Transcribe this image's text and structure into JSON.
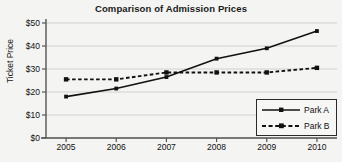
{
  "chart_data": {
    "type": "line",
    "title": "Comparison of Admission Prices",
    "xlabel": "",
    "ylabel": "Ticket Price",
    "categories": [
      "2005",
      "2006",
      "2007",
      "2008",
      "2009",
      "2010"
    ],
    "x": [
      2005,
      2006,
      2007,
      2008,
      2009,
      2010
    ],
    "ylim": [
      0,
      50
    ],
    "xlim": [
      2004.6,
      2010.4
    ],
    "yticks": [
      0,
      10,
      20,
      30,
      40,
      50
    ],
    "ytick_labels": [
      "$0",
      "$10",
      "$20",
      "$30",
      "$40",
      "$50"
    ],
    "xtick_labels": [
      "2005",
      "2006",
      "2007",
      "2008",
      "2009",
      "2010"
    ],
    "grid": true,
    "grid_axis": "y",
    "legend_position": "bottom-right",
    "series": [
      {
        "name": "Park A",
        "values": [
          18,
          21.5,
          26.5,
          34.5,
          39,
          46.5
        ],
        "line_style": "solid",
        "color": "#111111",
        "marker": "square"
      },
      {
        "name": "Park B",
        "values": [
          25.5,
          25.5,
          28.5,
          28.5,
          28.5,
          30.5
        ],
        "line_style": "dashed",
        "color": "#111111",
        "marker": "square"
      }
    ]
  },
  "colors": {
    "background": "#f4f4f2",
    "axis": "#555555",
    "grid": "#c9c9c9",
    "series": "#111111",
    "text": "#111111"
  }
}
